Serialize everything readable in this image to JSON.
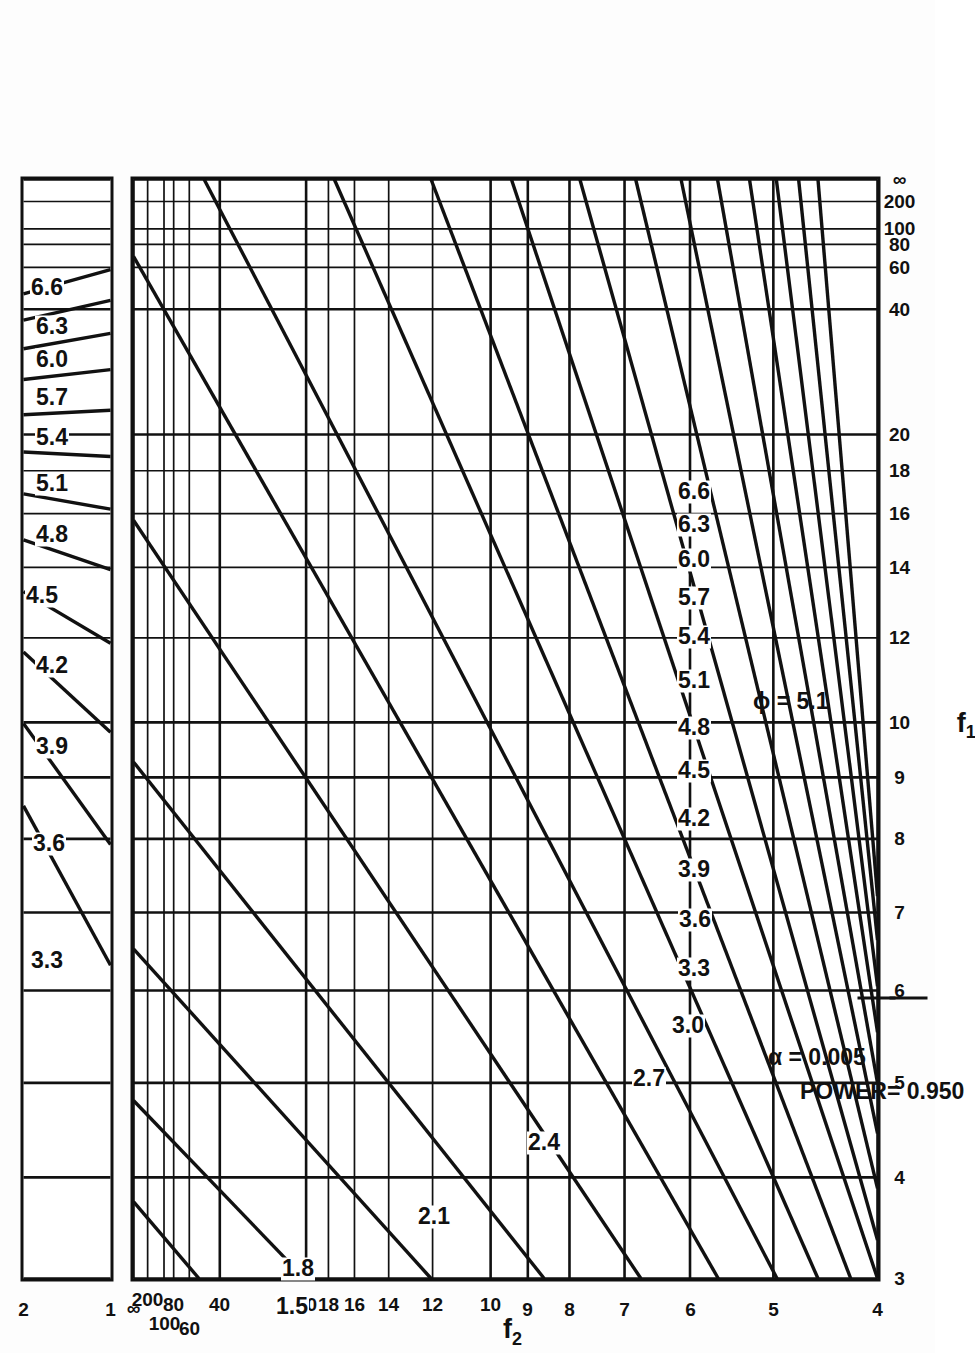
{
  "figure": {
    "kind": "pearson-hartley-power-chart",
    "orientation": "rotated-90-ccw",
    "annotations": {
      "alpha": "α  = 0.005",
      "power": "POWER= 0.950",
      "phi_marker": "ϕ = 5.1"
    },
    "axes": {
      "x": {
        "title_main": "f",
        "title_sub": "1",
        "name": "f1"
      },
      "y": {
        "title_main": "f",
        "title_sub": "2",
        "name": "f2"
      }
    }
  },
  "chart_data": {
    "type": "line",
    "title": "",
    "subtitle": "",
    "xlabel": "f1",
    "ylabel": "f2",
    "legend_position": "in-plot-curve-labels",
    "grid": true,
    "annotations": [
      "α  = 0.005",
      "POWER= 0.950",
      "ϕ = 5.1"
    ],
    "main_panel": {
      "x_ticks": [
        "3",
        "4",
        "5",
        "6",
        "7",
        "8",
        "9",
        "10",
        "12",
        "14",
        "16",
        "18",
        "20",
        "40",
        "60",
        "80",
        "100",
        "200",
        "∞"
      ],
      "x_tick_values": [
        3,
        4,
        5,
        6,
        7,
        8,
        9,
        10,
        12,
        14,
        16,
        18,
        20,
        40,
        60,
        80,
        100,
        200,
        400
      ],
      "y_ticks": [
        "4",
        "5",
        "6",
        "7",
        "8",
        "9",
        "10",
        "12",
        "14",
        "16",
        "18",
        "20",
        "40",
        "60",
        "80",
        "100",
        "200",
        "∞"
      ],
      "y_tick_values": [
        4,
        5,
        6,
        7,
        8,
        9,
        10,
        12,
        14,
        16,
        18,
        20,
        40,
        60,
        80,
        100,
        200,
        400
      ],
      "xlim": [
        3,
        400
      ],
      "ylim": [
        4,
        400
      ],
      "curve_labels": [
        "1.5",
        "1.8",
        "2.1",
        "2.4",
        "2.7",
        "3.0",
        "3.3",
        "3.6",
        "3.9",
        "4.2",
        "4.5",
        "4.8",
        "5.1",
        "5.4",
        "5.7",
        "6.0",
        "6.3",
        "6.6"
      ],
      "series": [
        {
          "name": "1.5",
          "values": [
            0.01,
            0.055
          ]
        },
        {
          "name": "1.8",
          "values": [
            0.035,
            0.11
          ]
        },
        {
          "name": "2.1",
          "values": [
            0.08,
            0.205
          ]
        },
        {
          "name": "2.4",
          "values": [
            0.14,
            0.33
          ]
        },
        {
          "name": "2.7",
          "values": [
            0.215,
            0.47
          ]
        },
        {
          "name": "3.0",
          "values": [
            0.3,
            0.61
          ]
        },
        {
          "name": "3.3",
          "values": [
            0.38,
            0.73
          ]
        },
        {
          "name": "3.6",
          "values": [
            0.455,
            0.815
          ]
        },
        {
          "name": "3.9",
          "values": [
            0.52,
            0.876
          ]
        },
        {
          "name": "4.2",
          "values": [
            0.578,
            0.918
          ]
        },
        {
          "name": "4.5",
          "values": [
            0.63,
            0.946
          ]
        },
        {
          "name": "4.8",
          "values": [
            0.676,
            0.963
          ]
        },
        {
          "name": "5.1",
          "values": [
            0.716,
            0.975
          ]
        },
        {
          "name": "5.4",
          "values": [
            0.752,
            0.983
          ]
        },
        {
          "name": "5.7",
          "values": [
            0.784,
            0.988
          ]
        },
        {
          "name": "6.0",
          "values": [
            0.813,
            0.992
          ]
        },
        {
          "name": "6.3",
          "values": [
            0.838,
            0.994
          ]
        },
        {
          "name": "6.6",
          "values": [
            0.861,
            0.996
          ]
        }
      ]
    },
    "aux_panel": {
      "x_ticks": [
        "1",
        "2"
      ],
      "x_tick_values": [
        1,
        2
      ],
      "xlim": [
        1,
        2
      ],
      "curve_labels": [
        "3.3",
        "3.6",
        "3.9",
        "4.2",
        "4.5",
        "4.8",
        "5.1",
        "5.4",
        "5.7",
        "6.0",
        "6.3",
        "6.6"
      ]
    }
  },
  "main_panel": {
    "x_ticks": [
      {
        "label": "3",
        "pos": 0.0
      },
      {
        "label": "4",
        "pos": 0.092
      },
      {
        "label": "5",
        "pos": 0.178
      },
      {
        "label": "6",
        "pos": 0.262
      },
      {
        "label": "7",
        "pos": 0.333
      },
      {
        "label": "8",
        "pos": 0.4
      },
      {
        "label": "9",
        "pos": 0.456
      },
      {
        "label": "10",
        "pos": 0.506
      },
      {
        "label": "12",
        "pos": 0.583
      },
      {
        "label": "14",
        "pos": 0.647
      },
      {
        "label": "16",
        "pos": 0.696
      },
      {
        "label": "18",
        "pos": 0.735
      },
      {
        "label": "20",
        "pos": 0.768
      },
      {
        "label": "40",
        "pos": 0.882
      },
      {
        "label": "60",
        "pos": 0.92
      },
      {
        "label": "80",
        "pos": 0.941
      },
      {
        "label": "100",
        "pos": 0.955
      },
      {
        "label": "200",
        "pos": 0.98
      },
      {
        "label": "∞",
        "pos": 1.0
      }
    ],
    "y_ticks": [
      {
        "label": "4",
        "pos": 0.0
      },
      {
        "label": "5",
        "pos": 0.14
      },
      {
        "label": "6",
        "pos": 0.252
      },
      {
        "label": "7",
        "pos": 0.34
      },
      {
        "label": "8",
        "pos": 0.414
      },
      {
        "label": "9",
        "pos": 0.47
      },
      {
        "label": "10",
        "pos": 0.52
      },
      {
        "label": "12",
        "pos": 0.598
      },
      {
        "label": "14",
        "pos": 0.657
      },
      {
        "label": "16",
        "pos": 0.703
      },
      {
        "label": "18",
        "pos": 0.738
      },
      {
        "label": "20",
        "pos": 0.768
      },
      {
        "label": "40",
        "pos": 0.884
      },
      {
        "label": "60",
        "pos": 0.925
      },
      {
        "label": "80",
        "pos": 0.946
      },
      {
        "label": "100",
        "pos": 0.959
      },
      {
        "label": "200",
        "pos": 0.981
      },
      {
        "label": "∞",
        "pos": 1.0
      }
    ],
    "curves": [
      {
        "label": "1.5",
        "x0": 0.0,
        "y0": 0.912,
        "x1": 0.07,
        "y1": 1.0,
        "lx": 0.003,
        "ly": 0.79
      },
      {
        "label": "1.8",
        "x0": 0.0,
        "y0": 0.77,
        "x1": 0.162,
        "y1": 1.0,
        "lx": 0.037,
        "ly": 0.782
      },
      {
        "label": "2.1",
        "x0": 0.0,
        "y0": 0.6,
        "x1": 0.3,
        "y1": 1.0,
        "lx": 0.085,
        "ly": 0.6
      },
      {
        "label": "2.4",
        "x0": 0.0,
        "y0": 0.448,
        "x1": 0.47,
        "y1": 1.0,
        "lx": 0.152,
        "ly": 0.452
      },
      {
        "label": "2.7",
        "x0": 0.0,
        "y0": 0.318,
        "x1": 0.69,
        "y1": 1.0,
        "lx": 0.21,
        "ly": 0.31
      },
      {
        "label": "3.0",
        "x0": 0.0,
        "y0": 0.214,
        "x1": 0.93,
        "y1": 1.0,
        "lx": 0.258,
        "ly": 0.258
      },
      {
        "label": "3.3",
        "x0": 0.0,
        "y0": 0.135,
        "x1": 1.0,
        "y1": 0.905,
        "lx": 0.31,
        "ly": 0.25
      },
      {
        "label": "3.6",
        "x0": 0.0,
        "y0": 0.08,
        "x1": 1.0,
        "y1": 0.73,
        "lx": 0.355,
        "ly": 0.248
      },
      {
        "label": "3.9",
        "x0": 0.0,
        "y0": 0.036,
        "x1": 1.0,
        "y1": 0.6,
        "lx": 0.4,
        "ly": 0.25
      },
      {
        "label": "4.2",
        "x0": 0.0,
        "y0": 0.0,
        "x1": 1.0,
        "y1": 0.492,
        "lx": 0.447,
        "ly": 0.25
      },
      {
        "label": "4.5",
        "x0": 0.035,
        "y0": 0.0,
        "x1": 1.0,
        "y1": 0.4,
        "lx": 0.49,
        "ly": 0.25
      },
      {
        "label": "4.8",
        "x0": 0.082,
        "y0": 0.0,
        "x1": 1.0,
        "y1": 0.325,
        "lx": 0.53,
        "ly": 0.25
      },
      {
        "label": "5.1",
        "x0": 0.132,
        "y0": 0.0,
        "x1": 1.0,
        "y1": 0.264,
        "lx": 0.572,
        "ly": 0.25
      },
      {
        "label": "5.4",
        "x0": 0.178,
        "y0": 0.0,
        "x1": 1.0,
        "y1": 0.215,
        "lx": 0.612,
        "ly": 0.25
      },
      {
        "label": "5.7",
        "x0": 0.224,
        "y0": 0.0,
        "x1": 1.0,
        "y1": 0.172,
        "lx": 0.648,
        "ly": 0.25
      },
      {
        "label": "6.0",
        "x0": 0.266,
        "y0": 0.0,
        "x1": 1.0,
        "y1": 0.136,
        "lx": 0.682,
        "ly": 0.25
      },
      {
        "label": "6.3",
        "x0": 0.308,
        "y0": 0.0,
        "x1": 1.0,
        "y1": 0.106,
        "lx": 0.714,
        "ly": 0.25
      },
      {
        "label": "6.6",
        "x0": 0.348,
        "y0": 0.0,
        "x1": 1.0,
        "y1": 0.08,
        "lx": 0.744,
        "ly": 0.25
      }
    ],
    "phi_label": {
      "text": "ϕ = 5.1",
      "lx": 0.572,
      "ly": 0.148
    },
    "alpha_note": {
      "text": "α  = 0.005",
      "lx": 0.258,
      "ly": 0.128
    },
    "power_note": {
      "text": "POWER= 0.950",
      "lx": 0.258,
      "ly": 0.085
    }
  },
  "aux_panel": {
    "x_ticks": [
      {
        "label": "1",
        "pos": 0.0
      },
      {
        "label": "2",
        "pos": 1.0
      }
    ],
    "curves": [
      {
        "label": "3.3",
        "x0": 0.285,
        "y0": 0.0,
        "x1": 0.43,
        "y1": 1.0,
        "lx": 0.318,
        "ly": 0.76
      },
      {
        "label": "3.6",
        "x0": 0.395,
        "y0": 0.0,
        "x1": 0.505,
        "y1": 1.0,
        "lx": 0.424,
        "ly": 0.74
      },
      {
        "label": "3.9",
        "x0": 0.497,
        "y0": 0.0,
        "x1": 0.57,
        "y1": 1.0,
        "lx": 0.512,
        "ly": 0.7
      },
      {
        "label": "4.2",
        "x0": 0.578,
        "y0": 0.0,
        "x1": 0.625,
        "y1": 1.0,
        "lx": 0.586,
        "ly": 0.7
      },
      {
        "label": "4.5",
        "x0": 0.645,
        "y0": 0.0,
        "x1": 0.672,
        "y1": 1.0,
        "lx": 0.65,
        "ly": 0.82
      },
      {
        "label": "4.8",
        "x0": 0.7,
        "y0": 0.0,
        "x1": 0.714,
        "y1": 1.0,
        "lx": 0.705,
        "ly": 0.7
      },
      {
        "label": "5.1",
        "x0": 0.748,
        "y0": 0.0,
        "x1": 0.752,
        "y1": 1.0,
        "lx": 0.752,
        "ly": 0.7
      },
      {
        "label": "5.4",
        "x0": 0.79,
        "y0": 0.0,
        "x1": 0.786,
        "y1": 1.0,
        "lx": 0.793,
        "ly": 0.7
      },
      {
        "label": "5.7",
        "x0": 0.827,
        "y0": 0.0,
        "x1": 0.818,
        "y1": 1.0,
        "lx": 0.83,
        "ly": 0.7
      },
      {
        "label": "6.0",
        "x0": 0.86,
        "y0": 0.0,
        "x1": 0.846,
        "y1": 1.0,
        "lx": 0.864,
        "ly": 0.7
      },
      {
        "label": "6.3",
        "x0": 0.89,
        "y0": 0.0,
        "x1": 0.872,
        "y1": 1.0,
        "lx": 0.894,
        "ly": 0.7
      },
      {
        "label": "6.6",
        "x0": 0.918,
        "y0": 0.0,
        "x1": 0.896,
        "y1": 1.0,
        "lx": 0.93,
        "ly": 0.76
      }
    ]
  }
}
